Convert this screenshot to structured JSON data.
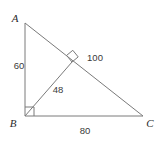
{
  "figure": {
    "stroke_color": "#7a7a7a",
    "label_color": "#2b2b2b",
    "measure_color": "#3a3a3a",
    "background": "#ffffff"
  },
  "vertices": [
    {
      "id": "A",
      "label": "A",
      "x": 25,
      "y": 23,
      "label_x": 15,
      "label_y": 22
    },
    {
      "id": "B",
      "label": "B",
      "x": 25,
      "y": 116,
      "label_x": 13,
      "label_y": 127
    },
    {
      "id": "C",
      "label": "C",
      "x": 143,
      "y": 116,
      "label_x": 147,
      "label_y": 127
    },
    {
      "id": "D",
      "label": "",
      "x": 72,
      "y": 62,
      "label_x": 0,
      "label_y": 0
    }
  ],
  "segments": [
    {
      "name": "side-AB",
      "from": "A",
      "to": "B"
    },
    {
      "name": "side-BC",
      "from": "B",
      "to": "C"
    },
    {
      "name": "side-AC",
      "from": "A",
      "to": "C"
    },
    {
      "name": "altitude-BD",
      "from": "B",
      "to": "D"
    }
  ],
  "measures": [
    {
      "name": "leg-AB-length",
      "value": "60",
      "x": 19,
      "y": 69,
      "anchor": "middle"
    },
    {
      "name": "hypotenuse-AC-length",
      "value": "100",
      "x": 95,
      "y": 61,
      "anchor": "middle"
    },
    {
      "name": "altitude-BD-length",
      "value": "48",
      "x": 58,
      "y": 93,
      "anchor": "middle"
    },
    {
      "name": "leg-BC-length",
      "value": "80",
      "x": 85,
      "y": 134,
      "anchor": "middle"
    }
  ],
  "right_angles": [
    {
      "name": "right-angle-at-B",
      "vertex": "B",
      "size": 9
    },
    {
      "name": "right-angle-at-D",
      "vertex": "D",
      "size": 8
    }
  ]
}
